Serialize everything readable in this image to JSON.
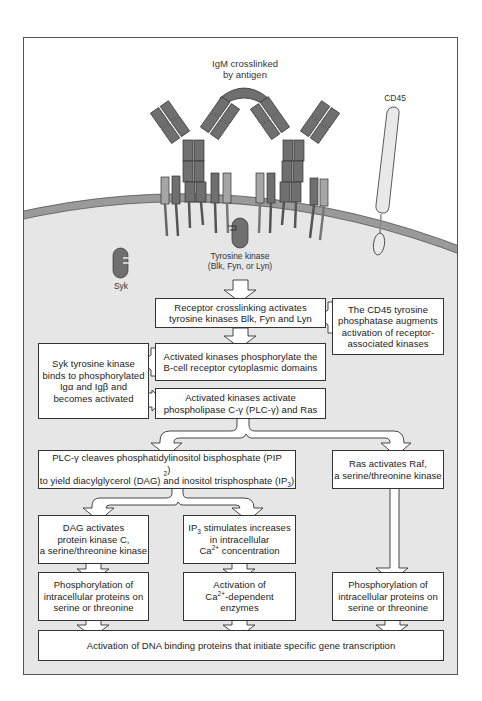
{
  "diagram": {
    "colors": {
      "frame_border": "#555555",
      "cytoplasm": "#e6e6e6",
      "membrane": "#9a9a9a",
      "receptor_dark": "#6f6f6f",
      "receptor_light": "#a6a6a6",
      "cd45_fill": "#e9e9e9",
      "box_fill": "#ffffff",
      "box_border": "#333333"
    },
    "labels": {
      "igm": [
        "IgM crosslinked",
        "by antigen"
      ],
      "cd45": "CD45",
      "tyrosine_kinase": [
        "Tyrosine kinase",
        "(Blk, Fyn, or Lyn)"
      ],
      "syk": "Syk"
    },
    "boxes": {
      "receptor_crosslinking": [
        "Receptor crosslinking activates",
        "tyrosine kinases Blk, Fyn and Lyn"
      ],
      "cd45_phosphatase": [
        "The CD45 tyrosine",
        "phosphatase augments",
        "activation of receptor-",
        "associated kinases"
      ],
      "phosphorylate_domains": [
        "Activated kinases phosphorylate the",
        "B-cell receptor cytoplasmic domains"
      ],
      "syk_binds": [
        "Syk tyrosine kinase",
        "binds to phosphorylated",
        "Igα and Igβ and",
        "becomes activated"
      ],
      "activate_plc": [
        "Activated kinases activate",
        "phospholipase C-γ (PLC-γ) and Ras"
      ],
      "plc_cleaves": {
        "line1_pre": "PLC-γ cleaves phosphatidylinositol bisphosphate (PIP",
        "line1_sub": "2",
        "line1_post": ")",
        "line2_pre": "to yield diacylglycerol (DAG) and inositol trisphosphate (IP",
        "line2_sub": "3",
        "line2_post": ")"
      },
      "ras_raf": [
        "Ras activates Raf,",
        "a serine/threonine kinase"
      ],
      "dag_pkc": [
        "DAG activates",
        "protein kinase C,",
        "a serine/threonine kinase"
      ],
      "ip3_calcium": {
        "line1_pre": "IP",
        "line1_sub": "3",
        "line1_post": " stimulates increases",
        "line2": "in intracellular",
        "line3_pre": "Ca",
        "line3_sup": "2+",
        "line3_post": " concentration"
      },
      "phos_left": [
        "Phosphorylation of",
        "intracellular proteins on",
        "serine or threonine"
      ],
      "ca_enzymes": {
        "line1": "Activation of",
        "line2_pre": "Ca",
        "line2_sup": "2+",
        "line2_post": "-dependent",
        "line3": "enzymes"
      },
      "phos_right": [
        "Phosphorylation of",
        "intracellular proteins on",
        "serine or threonine"
      ],
      "dna_binding": "Activation of DNA binding proteins that initiate specific gene transcription"
    }
  }
}
